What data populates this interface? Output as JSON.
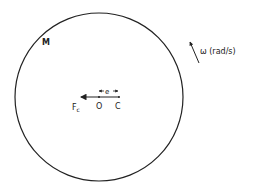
{
  "diagram": {
    "type": "rotating-unbalanced-disc",
    "labels": {
      "mass": "M",
      "omega": "ω (rad/s)",
      "force": "F",
      "force_sub": "c",
      "origin": "O",
      "center": "C",
      "eccentricity": "e"
    },
    "colors": {
      "stroke": "#222222",
      "background": "#ffffff"
    }
  }
}
